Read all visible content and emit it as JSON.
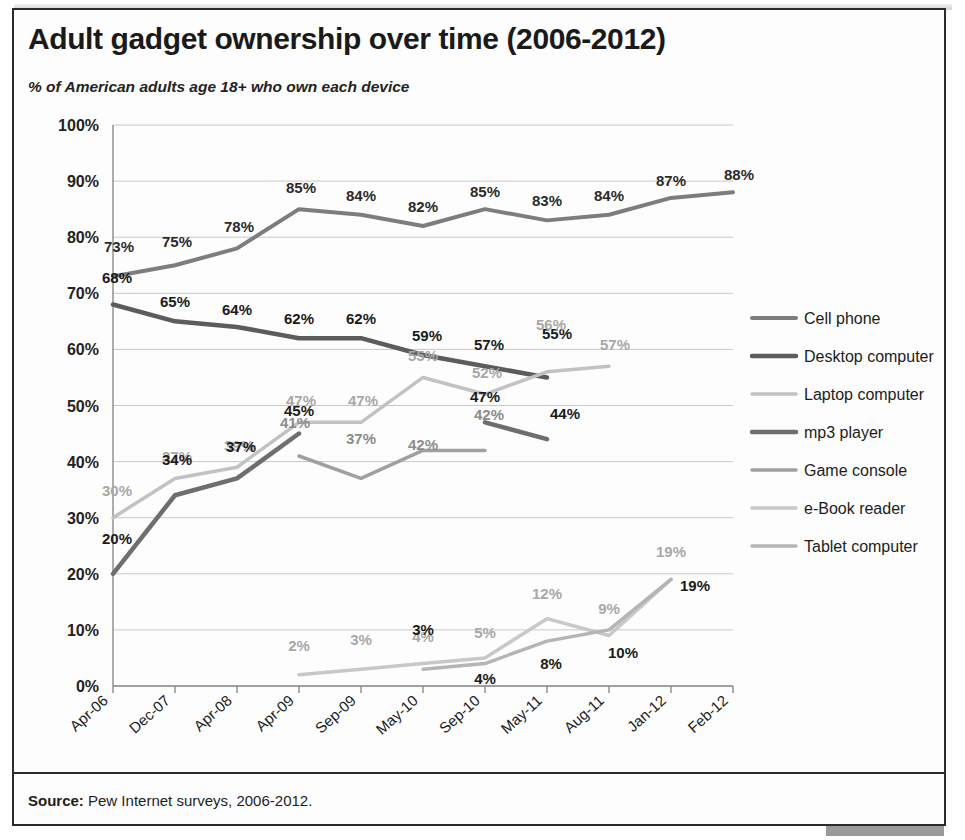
{
  "header": {
    "title": "Adult gadget ownership over time (2006-2012)",
    "subtitle": "% of American adults age 18+ who own each device"
  },
  "footer": {
    "source_label": "Source:",
    "source_text": " Pew Internet surveys, 2006-2012."
  },
  "chart_data": {
    "type": "line",
    "title": "Adult gadget ownership over time (2006-2012)",
    "subtitle": "% of American adults age 18+ who own each device",
    "xlabel": "",
    "ylabel": "",
    "ylim": [
      0,
      100
    ],
    "yticks": [
      "0%",
      "10%",
      "20%",
      "30%",
      "40%",
      "50%",
      "60%",
      "70%",
      "80%",
      "90%",
      "100%"
    ],
    "grid": true,
    "legend_position": "right",
    "categories": [
      "Apr-06",
      "Dec-07",
      "Apr-08",
      "Apr-09",
      "Sep-09",
      "May-10",
      "Sep-10",
      "May-11",
      "Aug-11",
      "Jan-12",
      "Feb-12"
    ],
    "series": [
      {
        "name": "Cell phone",
        "color": "#7d7d7d",
        "width": 4,
        "label_color": "#2b2b2b",
        "values": [
          73,
          75,
          78,
          85,
          84,
          82,
          85,
          83,
          84,
          87,
          88
        ],
        "labels": [
          "73%",
          "75%",
          "78%",
          "85%",
          "84%",
          "82%",
          "85%",
          "83%",
          "84%",
          "87%",
          "88%"
        ]
      },
      {
        "name": "Desktop computer",
        "color": "#5c5c5c",
        "width": 4.5,
        "label_color": "#1a1a1a",
        "values": [
          68,
          65,
          64,
          62,
          62,
          59,
          57,
          55,
          null,
          null,
          null
        ],
        "labels": [
          "68%",
          "65%",
          "64%",
          "62%",
          "62%",
          "59%",
          "57%",
          "55%",
          "",
          "",
          ""
        ]
      },
      {
        "name": "Laptop computer",
        "color": "#c2c2c2",
        "width": 3.5,
        "label_color": "#a8a8a8",
        "values": [
          30,
          37,
          39,
          47,
          47,
          55,
          52,
          56,
          57,
          null,
          null
        ],
        "labels": [
          "30%",
          "37%",
          "39%",
          "47%",
          "47%",
          "55%",
          "52%",
          "56%",
          "57%",
          "",
          ""
        ]
      },
      {
        "name": "mp3 player",
        "color": "#6e6e6e",
        "width": 4.5,
        "label_color": "#1a1a1a",
        "values": [
          20,
          34,
          37,
          45,
          null,
          null,
          47,
          44,
          null,
          null,
          null
        ],
        "labels": [
          "20%",
          "34%",
          "37%",
          "45%",
          "",
          "",
          "47%",
          "44%",
          "",
          "",
          ""
        ]
      },
      {
        "name": "Game console",
        "color": "#a0a0a0",
        "width": 3.5,
        "label_color": "#8c8c8c",
        "values": [
          null,
          null,
          null,
          41,
          37,
          42,
          42,
          null,
          null,
          null,
          null
        ],
        "labels": [
          "",
          "",
          "",
          "41%",
          "37%",
          "42%",
          "42%",
          "",
          "",
          "",
          ""
        ]
      },
      {
        "name": "e-Book reader",
        "color": "#c8c8c8",
        "width": 3.5,
        "label_color": "#a8a8a8",
        "values": [
          null,
          null,
          null,
          2,
          3,
          4,
          5,
          12,
          9,
          19,
          null
        ],
        "labels": [
          "",
          "",
          "",
          "2%",
          "3%",
          "4%",
          "5%",
          "12%",
          "9%",
          "19%",
          ""
        ]
      },
      {
        "name": "Tablet computer",
        "color": "#b5b5b5",
        "width": 3.5,
        "label_color": "#1a1a1a",
        "values": [
          null,
          null,
          null,
          null,
          null,
          3,
          4,
          8,
          10,
          19,
          null
        ],
        "labels": [
          "",
          "",
          "",
          "",
          "",
          "3%",
          "4%",
          "8%",
          "10%",
          "19%",
          ""
        ]
      }
    ]
  },
  "legend": {
    "items": [
      {
        "label": "Cell phone",
        "color": "#7d7d7d"
      },
      {
        "label": "Desktop computer",
        "color": "#5c5c5c"
      },
      {
        "label": "Laptop computer",
        "color": "#c2c2c2"
      },
      {
        "label": "mp3 player",
        "color": "#6e6e6e"
      },
      {
        "label": "Game console",
        "color": "#a0a0a0"
      },
      {
        "label": "e-Book reader",
        "color": "#c8c8c8"
      },
      {
        "label": "Tablet computer",
        "color": "#b5b5b5"
      }
    ]
  },
  "label_offsets": {
    "Cell phone": [
      [
        6,
        24
      ],
      [
        2,
        18
      ],
      [
        2,
        16
      ],
      [
        2,
        16
      ],
      [
        0,
        14
      ],
      [
        0,
        14
      ],
      [
        0,
        12
      ],
      [
        0,
        14
      ],
      [
        0,
        14
      ],
      [
        0,
        12
      ],
      [
        6,
        12
      ]
    ],
    "Desktop computer": [
      [
        4,
        22
      ],
      [
        0,
        14
      ],
      [
        0,
        12
      ],
      [
        0,
        14
      ],
      [
        0,
        14
      ],
      [
        4,
        14
      ],
      [
        4,
        16
      ],
      [
        10,
        38
      ],
      [
        0,
        0
      ],
      [
        0,
        0
      ],
      [
        0,
        0
      ]
    ],
    "Laptop computer": [
      [
        4,
        22
      ],
      [
        2,
        16
      ],
      [
        2,
        16
      ],
      [
        2,
        16
      ],
      [
        2,
        16
      ],
      [
        0,
        16
      ],
      [
        2,
        16
      ],
      [
        4,
        42
      ],
      [
        6,
        16
      ],
      [
        0,
        0
      ],
      [
        0,
        0
      ]
    ],
    "mp3 player": [
      [
        4,
        30
      ],
      [
        2,
        30
      ],
      [
        4,
        26
      ],
      [
        0,
        18
      ],
      [
        0,
        0
      ],
      [
        0,
        0
      ],
      [
        0,
        20
      ],
      [
        18,
        20
      ],
      [
        0,
        0
      ],
      [
        0,
        0
      ],
      [
        0,
        0
      ]
    ],
    "Game console": [
      [
        0,
        0
      ],
      [
        0,
        0
      ],
      [
        0,
        0
      ],
      [
        -4,
        28
      ],
      [
        0,
        34
      ],
      [
        0,
        0
      ],
      [
        4,
        30
      ],
      [
        0,
        0
      ],
      [
        0,
        0
      ],
      [
        0,
        0
      ],
      [
        0,
        0
      ]
    ],
    "e-Book reader": [
      [
        0,
        0
      ],
      [
        0,
        0
      ],
      [
        0,
        0
      ],
      [
        0,
        24
      ],
      [
        0,
        24
      ],
      [
        0,
        22
      ],
      [
        0,
        20
      ],
      [
        0,
        20
      ],
      [
        0,
        22
      ],
      [
        0,
        22
      ],
      [
        0,
        0
      ]
    ],
    "Tablet computer": [
      [
        0,
        0
      ],
      [
        0,
        0
      ],
      [
        0,
        0
      ],
      [
        0,
        0
      ],
      [
        0,
        0
      ],
      [
        0,
        34
      ],
      [
        0,
        -20
      ],
      [
        4,
        -28
      ],
      [
        14,
        -28
      ],
      [
        24,
        -12
      ],
      [
        0,
        0
      ]
    ]
  }
}
